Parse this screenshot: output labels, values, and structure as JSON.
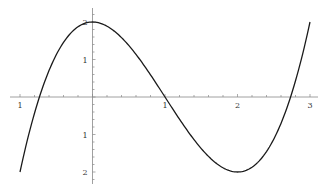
{
  "chart_data": {
    "type": "line",
    "title": "",
    "xlabel": "",
    "ylabel": "",
    "function": "x^3 - 3x^2 + 2",
    "xlim": [
      -1.1,
      3.1
    ],
    "ylim": [
      -2.3,
      2.3
    ],
    "grid": false,
    "legend": null,
    "x_ticks": [
      -1,
      0,
      1,
      2,
      3
    ],
    "x_tick_labels": [
      "1",
      "",
      "1",
      "2",
      "3"
    ],
    "y_ticks": [
      -2,
      -1,
      1,
      2
    ],
    "y_tick_labels": [
      "2",
      "1",
      "1",
      "2"
    ],
    "minor_tick_step": 0.2,
    "series": [
      {
        "name": "f(x)",
        "x": [
          -1,
          -0.75,
          -0.5,
          -0.25,
          0,
          0.25,
          0.5,
          0.75,
          1,
          1.25,
          1.5,
          1.75,
          2,
          2.25,
          2.5,
          2.75,
          3
        ],
        "y": [
          -2,
          -0.11,
          1.13,
          1.8,
          2,
          1.83,
          1.38,
          0.73,
          0,
          -0.73,
          -1.38,
          -1.83,
          -2,
          -1.8,
          -1.13,
          0.11,
          2
        ]
      }
    ],
    "colors": {
      "curve": "#1a1a1a",
      "axis": "#888888",
      "background": "#ffffff"
    }
  }
}
